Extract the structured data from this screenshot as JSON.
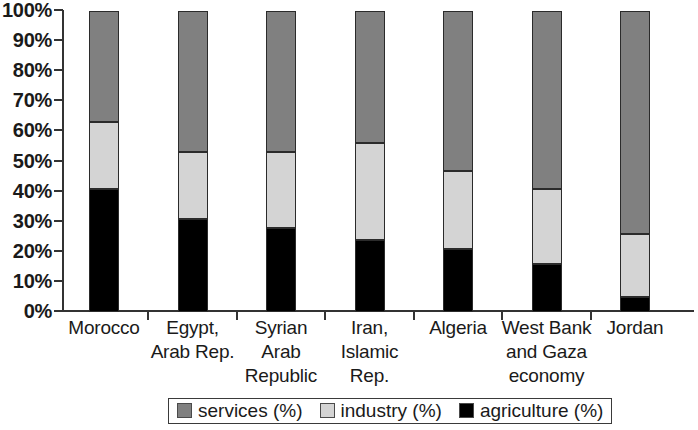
{
  "chart_data": {
    "type": "bar",
    "subtype": "stacked-bar-100-percent",
    "title": "",
    "xlabel": "",
    "ylabel": "",
    "ylim": [
      0,
      100
    ],
    "grid": false,
    "legend_position": "bottom-center",
    "categories": [
      "Morocco",
      "Egypt, Arab Rep.",
      "Syrian Arab Republic",
      "Iran, Islamic Rep.",
      "Algeria",
      "West Bank and Gaza economy",
      "Jordan"
    ],
    "category_lines": [
      [
        "Morocco"
      ],
      [
        "Egypt,",
        "Arab Rep."
      ],
      [
        "Syrian",
        "Arab",
        "Republic"
      ],
      [
        "Iran,",
        "Islamic",
        "Rep."
      ],
      [
        "Algeria"
      ],
      [
        "West Bank",
        "and Gaza",
        "economy"
      ],
      [
        "Jordan"
      ]
    ],
    "series": [
      {
        "name": "agriculture (%)",
        "color": "#000000",
        "values": [
          41,
          31,
          28,
          24,
          21,
          16,
          5
        ]
      },
      {
        "name": "industry (%)",
        "color": "#d4d4d4",
        "values": [
          22,
          22,
          25,
          32,
          26,
          25,
          21
        ]
      },
      {
        "name": "services (%)",
        "color": "#808080",
        "values": [
          37,
          47,
          47,
          44,
          53,
          59,
          74
        ]
      }
    ],
    "stack_tops": {
      "agriculture": [
        41,
        31,
        28,
        24,
        21,
        16,
        5
      ],
      "agriculture_plus_industry": [
        63,
        53,
        53,
        56,
        47,
        41,
        26
      ],
      "total": [
        100,
        100,
        100,
        100,
        100,
        100,
        100
      ]
    },
    "y_ticks": [
      "0%",
      "10%",
      "20%",
      "30%",
      "40%",
      "50%",
      "60%",
      "70%",
      "80%",
      "90%",
      "100%"
    ],
    "y_tick_values": [
      0,
      10,
      20,
      30,
      40,
      50,
      60,
      70,
      80,
      90,
      100
    ]
  },
  "legend": {
    "items": [
      {
        "label": "services (%)",
        "color": "#808080"
      },
      {
        "label": "industry (%)",
        "color": "#d4d4d4"
      },
      {
        "label": "agriculture (%)",
        "color": "#000000"
      }
    ]
  }
}
